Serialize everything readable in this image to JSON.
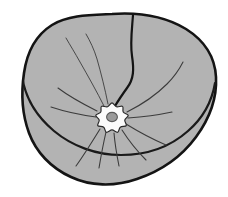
{
  "figure": {
    "title": "Cup-shaped anatomical structure with central scalloped hub",
    "type": "line-drawing",
    "canvas": {
      "width": 228,
      "height": 197
    },
    "background_color": "#ffffff"
  },
  "palette": {
    "body_fill": "#b3b3b3",
    "rim_fill": "#b0b0b0",
    "hub_fill": "#fbfbfb",
    "hub_center_fill": "#9a9a9a",
    "outline_stroke": "#141414",
    "rim_stroke": "#1a1a1a",
    "detail_stroke": "#3c3c3c",
    "hub_stroke": "#2a2a2a",
    "hub_center_stroke": "#5a5a5a"
  },
  "strokes": {
    "outline_width": 2.6,
    "rim_width": 2.2,
    "crease_width": 2.2,
    "spoke_width": 1.1,
    "hair_width": 0.9,
    "hub_width": 1.2,
    "hub_center_width": 1.1
  },
  "geometry": {
    "outer_body_path": "M 112 14 C 140 12 166 17 186 29 C 205 41 215 58 216 77 C 217 97 210 118 196 137 C 182 156 161 171 137 179 C 114 187 90 186 71 177 C 51 168 36 152 29 133 C 22 114 21 93 24 73 C 27 52 36 35 52 25 C 68 15 90 15 112 14 Z",
    "rim_path": "M 22 76 C 25 97 36 116 54 131 C 72 146 96 155 121 155 C 146 155 170 147 188 131 C 203 118 212 101 215 83",
    "rim_lower_edge_path": "M 29 133 C 22 114 21 93 24 73",
    "crease_path": "M 133 15 C 132 29 130 43 132 56 C 134 69 134 79 127 88 C 122 95 118 101 115 106",
    "hub": {
      "cx": 112,
      "cy": 118,
      "outer_r": 16,
      "lobe_count": 9,
      "lobe_depth": 3.4,
      "center_rx": 5.4,
      "center_ry": 4.6
    },
    "spokes": [
      {
        "name": "spoke-sw-outer",
        "path": "M 100 129 C 92 142 84 155 76 166"
      },
      {
        "name": "spoke-s-left",
        "path": "M 106 132 C 103 145 101 156 99 168"
      },
      {
        "name": "spoke-s",
        "path": "M 114 133 C 115 145 117 156 119 166"
      },
      {
        "name": "spoke-se",
        "path": "M 122 130 C 129 141 137 151 146 160"
      },
      {
        "name": "spoke-se-far",
        "path": "M 126 124 C 139 132 152 139 166 145"
      },
      {
        "name": "spoke-e",
        "path": "M 128 118 C 143 117 158 115 172 112"
      },
      {
        "name": "spoke-ene",
        "path": "M 127 112 C 141 105 155 96 167 84 C 174 77 179 70 183 62"
      },
      {
        "name": "spoke-w",
        "path": "M 96 117 C 81 115 66 112 51 107"
      },
      {
        "name": "spoke-wnw",
        "path": "M 97 111 C 83 104 70 97 58 88"
      }
    ],
    "hairs": [
      {
        "name": "hair-nw-long",
        "path": "M 104 106 C 97 92 88 76 80 62 C 75 53 70 45 66 38"
      },
      {
        "name": "hair-n-long",
        "path": "M 108 104 C 105 89 101 73 97 59 C 94 49 90 41 86 34"
      }
    ]
  },
  "annotations": {
    "labels": [],
    "legend": []
  }
}
